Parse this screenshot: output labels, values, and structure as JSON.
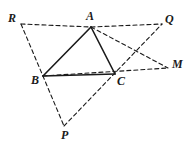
{
  "figure": {
    "background_color": "#ffffff",
    "stroke_color": "#1a1a1a",
    "label_color": "#1a1a1a",
    "width": 193,
    "height": 154
  },
  "points": {
    "A": {
      "label": "A",
      "x": 91,
      "y": 27,
      "label_x": 86,
      "label_y": 10
    },
    "B": {
      "label": "B",
      "x": 43,
      "y": 76,
      "label_x": 31,
      "label_y": 74
    },
    "C": {
      "label": "C",
      "x": 115,
      "y": 74,
      "label_x": 117,
      "label_y": 75
    },
    "P": {
      "label": "P",
      "x": 64,
      "y": 126,
      "label_x": 61,
      "label_y": 129
    },
    "Q": {
      "label": "Q",
      "x": 162,
      "y": 24,
      "label_x": 165,
      "label_y": 13
    },
    "R": {
      "label": "R",
      "x": 21,
      "y": 24,
      "label_x": 8,
      "label_y": 12
    },
    "M": {
      "label": "M",
      "x": 168,
      "y": 68,
      "label_x": 172,
      "label_y": 58
    }
  },
  "segments": {
    "solid": [
      {
        "name": "segment-AB",
        "from": "A",
        "to": "B"
      },
      {
        "name": "segment-AC",
        "from": "A",
        "to": "C"
      },
      {
        "name": "segment-BC",
        "from": "B",
        "to": "C"
      }
    ],
    "dashed": [
      {
        "name": "segment-RA",
        "from": "R",
        "to": "A"
      },
      {
        "name": "segment-AQ",
        "from": "A",
        "to": "Q"
      },
      {
        "name": "segment-RP",
        "from": "R",
        "to": "P"
      },
      {
        "name": "segment-PQ",
        "from": "P",
        "to": "Q"
      },
      {
        "name": "segment-AM",
        "from": "A",
        "to": "M"
      },
      {
        "name": "segment-BM",
        "from": "B",
        "to": "M"
      }
    ]
  },
  "style": {
    "solid_width": 1.6,
    "dashed_width": 1.1,
    "dash_pattern": "4 3"
  }
}
